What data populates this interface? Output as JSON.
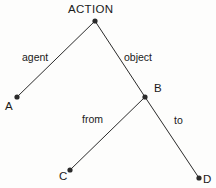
{
  "canvas": {
    "width": 216,
    "height": 188,
    "background": "#fdfdfc",
    "ink": "#2b2b2b",
    "text_color": "#1a1a1a"
  },
  "chart_data": {
    "type": "diagram",
    "title": "ACTION",
    "nodes": [
      {
        "id": "ACTION",
        "label": "ACTION",
        "x": 95,
        "y": 21,
        "label_x": 68,
        "label_y": 4,
        "dot": true
      },
      {
        "id": "A",
        "label": "A",
        "x": 17,
        "y": 97,
        "label_x": 5,
        "label_y": 101,
        "dot": true
      },
      {
        "id": "B",
        "label": "B",
        "x": 145,
        "y": 97,
        "label_x": 154,
        "label_y": 83,
        "dot": true
      },
      {
        "id": "C",
        "label": "C",
        "x": 70,
        "y": 170,
        "label_x": 59,
        "label_y": 171,
        "dot": true
      },
      {
        "id": "D",
        "label": "D",
        "x": 199,
        "y": 178,
        "label_x": 203,
        "label_y": 174,
        "dot": true
      }
    ],
    "edges": [
      {
        "from": "ACTION",
        "to": "A",
        "label": "agent",
        "label_x": 22,
        "label_y": 52
      },
      {
        "from": "ACTION",
        "to": "B",
        "label": "object",
        "label_x": 124,
        "label_y": 52
      },
      {
        "from": "B",
        "to": "C",
        "label": "from",
        "label_x": 82,
        "label_y": 114
      },
      {
        "from": "B",
        "to": "D",
        "label": "to",
        "label_x": 174,
        "label_y": 115
      }
    ],
    "legend": [],
    "grid": false
  }
}
